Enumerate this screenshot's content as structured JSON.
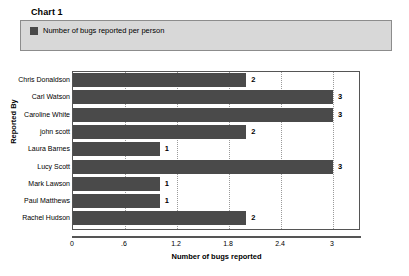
{
  "chart_title": "Chart 1",
  "legend": {
    "entries": [
      {
        "label": "Number of bugs reported per person",
        "color": "#4a4a4a"
      }
    ]
  },
  "colors": {
    "bar": "#4a4a4a",
    "legend_panel_background": "#d8d8d8",
    "legend_panel_border": "#8c8c8c",
    "plot_border": "#555555",
    "gridline": "#9a9a9a",
    "plot_background": "#ffffff"
  },
  "chart_data": {
    "type": "bar",
    "orientation": "horizontal",
    "title": "Chart 1",
    "series_name": "Number of bugs reported per person",
    "categories": [
      "Chris Donaldson",
      "Carl Watson",
      "Caroline White",
      "john scott",
      "Laura Barnes",
      "Lucy Scott",
      "Mark Lawson",
      "Paul Matthews",
      "Rachel Hudson"
    ],
    "values": [
      2,
      3,
      3,
      2,
      1,
      3,
      1,
      1,
      2
    ],
    "data_labels": [
      "2",
      "3",
      "3",
      "2",
      "1",
      "3",
      "1",
      "1",
      "2"
    ],
    "xlabel": "Number of bugs reported",
    "ylabel": "Reported By",
    "xlim": [
      0,
      3.3
    ],
    "xticks": [
      0,
      0.6,
      1.2,
      1.8,
      2.4,
      3
    ],
    "xtick_labels": [
      "0",
      ".6",
      "1.2",
      "1.8",
      "2.4",
      "3"
    ],
    "grid": true,
    "grid_axis": "x",
    "legend_position": "top"
  }
}
